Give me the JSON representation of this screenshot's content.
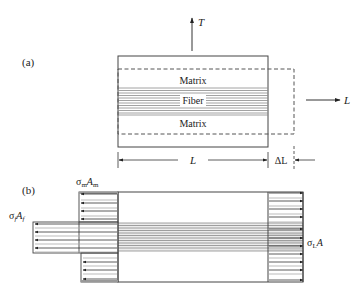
{
  "figure": {
    "panel_a": {
      "label": "(a)",
      "axis_T": "T",
      "axis_L": "L",
      "matrix_top_label": "Matrix",
      "fiber_label": "Fiber",
      "matrix_bottom_label": "Matrix"
    },
    "dimension": {
      "length_label": "L",
      "delta_label": "ΔL"
    },
    "panel_b": {
      "label": "(b)",
      "matrix_force": {
        "sigma": "σ",
        "sub1": "m",
        "A": "A",
        "sub2": "m"
      },
      "fiber_force": {
        "sigma": "σ",
        "sub1": "f",
        "A": "A",
        "sub2": "f"
      },
      "total_force": {
        "sigma": "σ",
        "sub1": "L",
        "A": "A"
      }
    },
    "colors": {
      "line": "#333333",
      "fiber_stripe": "#8a8a8a",
      "fiber_shade": "#d9d9d9",
      "background": "#ffffff"
    }
  }
}
